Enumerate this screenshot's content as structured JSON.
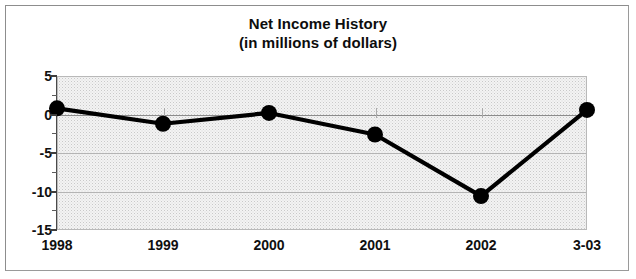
{
  "chart_data": {
    "type": "line",
    "title": "Net Income History",
    "subtitle": "(in millions of dollars)",
    "xlabel": "",
    "ylabel": "",
    "categories": [
      "1998",
      "1999",
      "2000",
      "2001",
      "2002",
      "3-03"
    ],
    "values": [
      0.8,
      -1.2,
      0.2,
      -2.6,
      -10.6,
      0.6
    ],
    "series": [
      {
        "name": "Net Income",
        "values": [
          0.8,
          -1.2,
          0.2,
          -2.6,
          -10.6,
          0.6
        ]
      }
    ],
    "ylim": [
      -15,
      5
    ],
    "ytick_labels": [
      "5",
      "0",
      "-5",
      "-10",
      "-15"
    ],
    "ytick_values": [
      5,
      0,
      -5,
      -10,
      -15
    ],
    "yminor_step": 2.5,
    "grid": true,
    "legend": false,
    "legend_position": "none",
    "line_color": "#000000",
    "marker": "circle",
    "marker_color": "#000000",
    "plot_background": "#f0f0f0",
    "frame_color": "#9a9a9a"
  },
  "title": {
    "line1": "Net Income History",
    "line2": "(in millions of dollars)"
  },
  "axes": {
    "y_labels": [
      {
        "text": "5",
        "value": 5
      },
      {
        "text": "0",
        "value": 0
      },
      {
        "text": "-5",
        "value": -5
      },
      {
        "text": "-10",
        "value": -10
      },
      {
        "text": "-15",
        "value": -15
      }
    ],
    "x_labels": [
      {
        "text": "1998"
      },
      {
        "text": "1999"
      },
      {
        "text": "2000"
      },
      {
        "text": "2001"
      },
      {
        "text": "2002"
      },
      {
        "text": "3-03"
      }
    ]
  }
}
